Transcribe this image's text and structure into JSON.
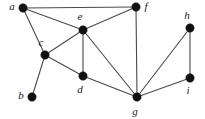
{
  "figure": {
    "background_color": "#ffffff",
    "edge_color": "#4a4a4a",
    "vertex_color": "#111111",
    "label_color": "#1a1a1a",
    "width": 205,
    "height": 119
  },
  "chart_data": {
    "type": "diagram",
    "diagram_kind": "undirected-graph",
    "title": "",
    "node_count": 9,
    "edge_count": 14,
    "nodes": [
      {
        "id": "a",
        "label": "a",
        "x": 23,
        "y": 8,
        "label_x": 12,
        "label_y": 7,
        "degree": 3
      },
      {
        "id": "b",
        "label": "b",
        "x": 32,
        "y": 97,
        "label_x": 21,
        "label_y": 96,
        "degree": 1
      },
      {
        "id": "c",
        "label": "c",
        "x": 45,
        "y": 55,
        "label_x": 41,
        "label_y": 43,
        "degree": 4
      },
      {
        "id": "d",
        "label": "d",
        "x": 83,
        "y": 76,
        "label_x": 80,
        "label_y": 90,
        "degree": 3
      },
      {
        "id": "e",
        "label": "e",
        "x": 83,
        "y": 30,
        "label_x": 80,
        "label_y": 17,
        "degree": 5
      },
      {
        "id": "f",
        "label": "f",
        "x": 136,
        "y": 7,
        "label_x": 146,
        "label_y": 7,
        "degree": 3
      },
      {
        "id": "g",
        "label": "g",
        "x": 137,
        "y": 97,
        "label_x": 135,
        "label_y": 112,
        "degree": 5
      },
      {
        "id": "h",
        "label": "h",
        "x": 190,
        "y": 28,
        "label_x": 187,
        "label_y": 16,
        "degree": 2
      },
      {
        "id": "i",
        "label": "i",
        "x": 190,
        "y": 78,
        "label_x": 188,
        "label_y": 91,
        "degree": 2
      }
    ],
    "edges": [
      {
        "source": "a",
        "target": "f"
      },
      {
        "source": "a",
        "target": "e"
      },
      {
        "source": "a",
        "target": "c"
      },
      {
        "source": "c",
        "target": "e"
      },
      {
        "source": "c",
        "target": "d"
      },
      {
        "source": "c",
        "target": "b"
      },
      {
        "source": "e",
        "target": "f"
      },
      {
        "source": "e",
        "target": "d"
      },
      {
        "source": "e",
        "target": "g"
      },
      {
        "source": "d",
        "target": "g"
      },
      {
        "source": "f",
        "target": "g"
      },
      {
        "source": "g",
        "target": "h"
      },
      {
        "source": "g",
        "target": "i"
      },
      {
        "source": "h",
        "target": "i"
      }
    ],
    "vertex_radius": 4.2
  }
}
